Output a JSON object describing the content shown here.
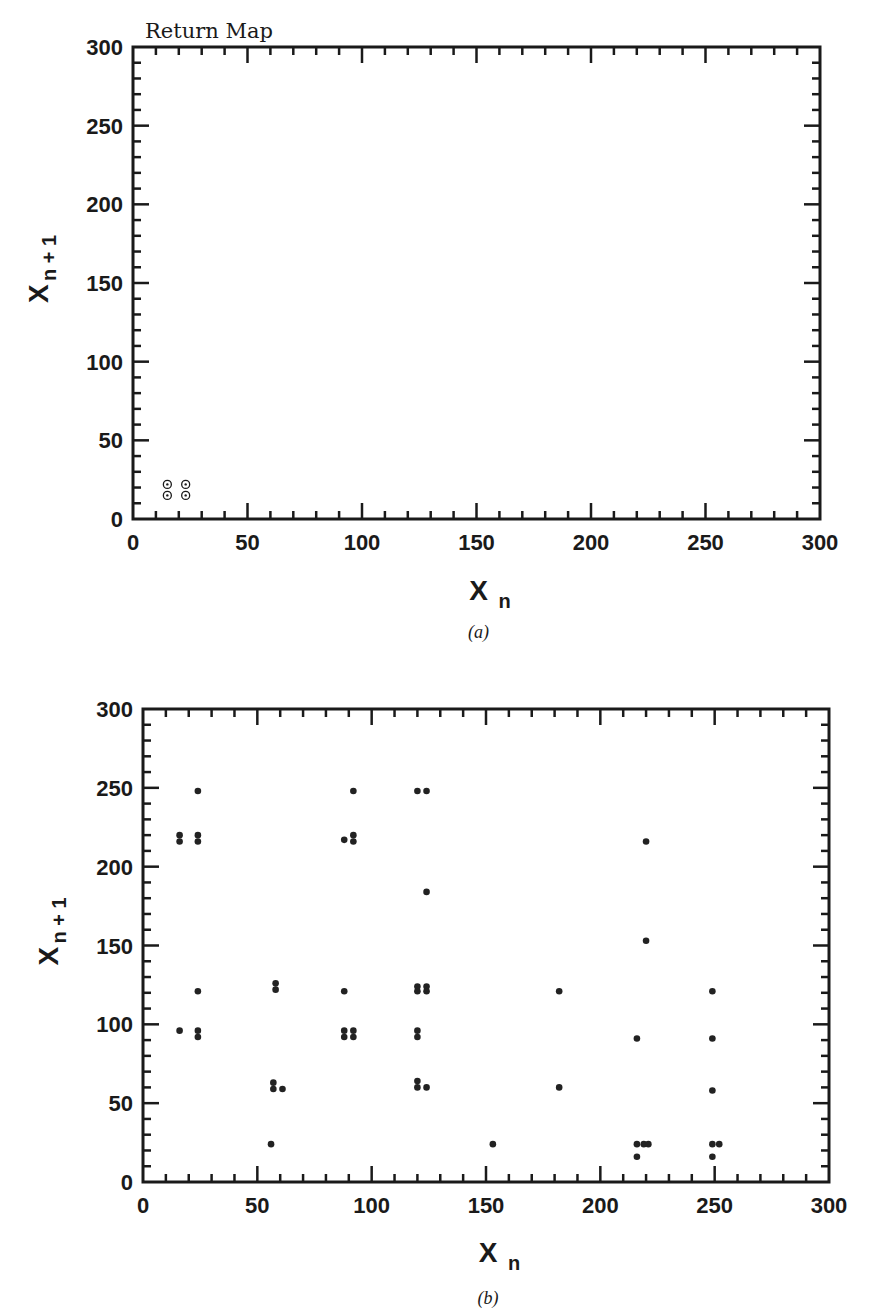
{
  "chart_data": [
    {
      "panel": "a",
      "type": "scatter",
      "title": "Return Map",
      "caption": "(a)",
      "xlabel": "X",
      "xlabel_sub": "n",
      "ylabel": "X",
      "ylabel_sub": "n+1",
      "xlim": [
        0,
        300
      ],
      "ylim": [
        0,
        300
      ],
      "xticks": [
        0,
        50,
        100,
        150,
        200,
        250,
        300
      ],
      "yticks": [
        0,
        50,
        100,
        150,
        200,
        250,
        300
      ],
      "minor_tick_step": 10,
      "grid": false,
      "marker": "circle-dot",
      "points": [
        [
          15,
          15
        ],
        [
          23,
          15
        ],
        [
          15,
          22
        ],
        [
          23,
          22
        ]
      ]
    },
    {
      "panel": "b",
      "type": "scatter",
      "title": "",
      "caption": "(b)",
      "xlabel": "X",
      "xlabel_sub": "n",
      "ylabel": "X",
      "ylabel_sub": "n+1",
      "xlim": [
        0,
        300
      ],
      "ylim": [
        0,
        300
      ],
      "xticks": [
        0,
        50,
        100,
        150,
        200,
        250,
        300
      ],
      "yticks": [
        0,
        50,
        100,
        150,
        200,
        250,
        300
      ],
      "minor_tick_step": 10,
      "grid": false,
      "marker": "filled-dot",
      "points": [
        [
          16,
          220
        ],
        [
          16,
          216
        ],
        [
          16,
          96
        ],
        [
          24,
          248
        ],
        [
          24,
          220
        ],
        [
          24,
          216
        ],
        [
          24,
          121
        ],
        [
          24,
          96
        ],
        [
          24,
          92
        ],
        [
          56,
          24
        ],
        [
          57,
          63
        ],
        [
          57,
          59
        ],
        [
          61,
          59
        ],
        [
          58,
          126
        ],
        [
          58,
          122
        ],
        [
          88,
          217
        ],
        [
          88,
          121
        ],
        [
          88,
          96
        ],
        [
          88,
          92
        ],
        [
          92,
          248
        ],
        [
          92,
          220
        ],
        [
          92,
          216
        ],
        [
          92,
          96
        ],
        [
          92,
          92
        ],
        [
          120,
          248
        ],
        [
          120,
          124
        ],
        [
          120,
          121
        ],
        [
          120,
          96
        ],
        [
          120,
          92
        ],
        [
          120,
          64
        ],
        [
          120,
          60
        ],
        [
          124,
          248
        ],
        [
          124,
          184
        ],
        [
          124,
          124
        ],
        [
          124,
          121
        ],
        [
          124,
          60
        ],
        [
          153,
          24
        ],
        [
          182,
          121
        ],
        [
          182,
          60
        ],
        [
          216,
          91
        ],
        [
          216,
          24
        ],
        [
          216,
          16
        ],
        [
          219,
          24
        ],
        [
          221,
          24
        ],
        [
          220,
          216
        ],
        [
          220,
          153
        ],
        [
          249,
          121
        ],
        [
          249,
          91
        ],
        [
          249,
          58
        ],
        [
          249,
          24
        ],
        [
          249,
          16
        ],
        [
          252,
          24
        ]
      ]
    }
  ]
}
